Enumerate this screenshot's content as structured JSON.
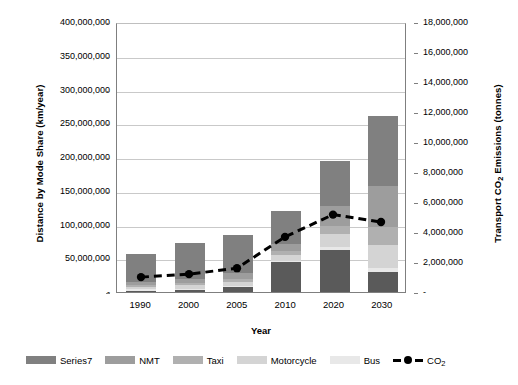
{
  "chart_data": {
    "type": "bar",
    "title": "",
    "xlabel": "Year",
    "ylabel": "Distance by Mode Share (km/year)",
    "ylabel_right": "Transport CO2 Emissions (tonnes)",
    "ylabel_right_prefix": "Transport CO",
    "ylabel_right_sub": "2",
    "ylabel_right_suffix": " Emissions (tonnes)",
    "categories": [
      "1990",
      "2000",
      "2005",
      "2010",
      "2020",
      "2030"
    ],
    "ylim": [
      0,
      400000000
    ],
    "ylim_right": [
      0,
      18000000
    ],
    "grid": true,
    "legend_position": "bottom",
    "stacked": true,
    "y_ticks": [
      "400,000,000",
      "350,000,000",
      "300,000,000",
      "250,000,000",
      "200,000,000",
      "150,000,000",
      "100,000,000",
      "50,000,000",
      "-"
    ],
    "y_ticks_right": [
      "18,000,000",
      "16,000,000",
      "14,000,000",
      "12,000,000",
      "10,000,000",
      "8,000,000",
      "6,000,000",
      "4,000,000",
      "2,000,000",
      "-"
    ],
    "series": [
      {
        "name": "Series7",
        "color": "#808080",
        "values": [
          42000000,
          52000000,
          57000000,
          49000000,
          67000000,
          104000000
        ]
      },
      {
        "name": "NMT",
        "color": "#9d9d9d",
        "values": [
          4000000,
          6000000,
          8000000,
          10000000,
          29000000,
          60000000
        ]
      },
      {
        "name": "Taxi",
        "color": "#b0b0b0",
        "values": [
          3000000,
          4000000,
          5000000,
          6000000,
          12000000,
          28000000
        ]
      },
      {
        "name": "Motorcycle",
        "color": "#d4d4d4",
        "values": [
          4000000,
          5000000,
          6000000,
          9000000,
          20000000,
          34000000
        ]
      },
      {
        "name": "Bus",
        "color": "#e8e8e8",
        "values": [
          2000000,
          2000000,
          2000000,
          2000000,
          4000000,
          5000000
        ]
      },
      {
        "name": "Bottom",
        "color": "#5a5a5a",
        "values": [
          2000000,
          3000000,
          7000000,
          44000000,
          62000000,
          30000000
        ]
      }
    ],
    "totals": [
      57000000,
      72000000,
      85000000,
      120000000,
      194000000,
      261000000
    ],
    "co2": {
      "name": "CO2",
      "label_prefix": "CO",
      "label_sub": "2",
      "color": "#000000",
      "values": [
        1000000,
        1200000,
        1600000,
        3700000,
        5200000,
        4700000
      ]
    },
    "legend": [
      {
        "label": "Series7",
        "color": "#808080",
        "type": "swatch"
      },
      {
        "label": "NMT",
        "color": "#9d9d9d",
        "type": "swatch"
      },
      {
        "label": "Taxi",
        "color": "#b0b0b0",
        "type": "swatch"
      },
      {
        "label": "Motorcycle",
        "color": "#d4d4d4",
        "type": "swatch"
      },
      {
        "label": "Bus",
        "color": "#e8e8e8",
        "type": "swatch"
      },
      {
        "label": "CO2",
        "color": "#000000",
        "type": "line"
      }
    ]
  }
}
